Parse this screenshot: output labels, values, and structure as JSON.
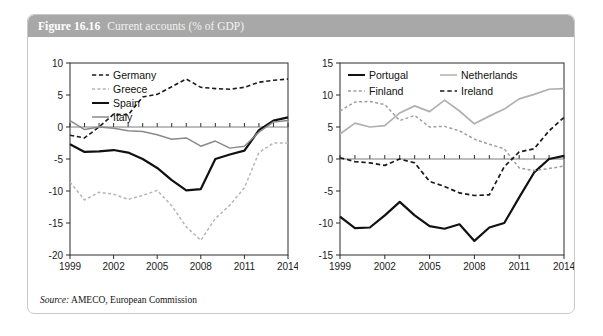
{
  "figure": {
    "number": "Figure 16.16",
    "caption": "Current accounts (% of GDP)",
    "source_label": "Source:",
    "source_text": "AMECO, European Commission",
    "header_color": "#a8a8a8",
    "border_color": "#c9c9c9"
  },
  "chart_data": [
    {
      "type": "line",
      "id": "left",
      "title": "",
      "xlabel": "",
      "ylabel": "",
      "grid": false,
      "legend_position": "top-left",
      "x": [
        1999,
        2000,
        2001,
        2002,
        2003,
        2004,
        2005,
        2006,
        2007,
        2008,
        2009,
        2010,
        2011,
        2012,
        2013,
        2014
      ],
      "xticks": [
        "1999",
        "2002",
        "2005",
        "2008",
        "2011",
        "2014"
      ],
      "xtick_values": [
        1999,
        2002,
        2005,
        2008,
        2011,
        2014
      ],
      "xlim": [
        1999,
        2014
      ],
      "yticks": [
        "10",
        "5",
        "0",
        "-5",
        "-10",
        "-15",
        "-20"
      ],
      "ytick_values": [
        10,
        5,
        0,
        -5,
        -10,
        -15,
        -20
      ],
      "ylim": [
        -20,
        10
      ],
      "series": [
        {
          "name": "Germany",
          "style": "dashed",
          "color": "#1a1a1a",
          "width": 1.6,
          "values": [
            -1.3,
            -1.7,
            0.0,
            2.0,
            1.9,
            4.7,
            5.1,
            6.3,
            7.5,
            6.2,
            6.0,
            5.9,
            6.2,
            7.0,
            7.3,
            7.5
          ]
        },
        {
          "name": "Greece",
          "style": "dotted",
          "color": "#b5b5b5",
          "width": 1.5,
          "values": [
            -8.6,
            -11.4,
            -10.2,
            -10.5,
            -11.3,
            -10.7,
            -9.9,
            -12.3,
            -15.6,
            -17.7,
            -14.3,
            -12.2,
            -9.5,
            -4.0,
            -2.5,
            -2.5
          ]
        },
        {
          "name": "Spain",
          "style": "solid",
          "color": "#111111",
          "width": 2.2,
          "values": [
            -2.7,
            -3.9,
            -3.8,
            -3.6,
            -4.0,
            -5.0,
            -6.4,
            -8.3,
            -9.9,
            -9.7,
            -5.0,
            -4.3,
            -3.7,
            -0.5,
            1.0,
            1.5
          ]
        },
        {
          "name": "Italy",
          "style": "solid",
          "color": "#8a8a8a",
          "width": 1.5,
          "values": [
            1.0,
            -0.4,
            0.0,
            -0.2,
            -0.6,
            -0.7,
            -1.2,
            -1.9,
            -1.7,
            -3.0,
            -2.2,
            -3.3,
            -3.0,
            -0.8,
            0.8,
            1.0
          ]
        }
      ]
    },
    {
      "type": "line",
      "id": "right",
      "title": "",
      "xlabel": "",
      "ylabel": "",
      "grid": false,
      "legend_position": "top",
      "x": [
        1999,
        2000,
        2001,
        2002,
        2003,
        2004,
        2005,
        2006,
        2007,
        2008,
        2009,
        2010,
        2011,
        2012,
        2013,
        2014
      ],
      "xticks": [
        "1999",
        "2002",
        "2005",
        "2008",
        "2011",
        "2014"
      ],
      "xtick_values": [
        1999,
        2002,
        2005,
        2008,
        2011,
        2014
      ],
      "xlim": [
        1999,
        2014
      ],
      "yticks": [
        "15",
        "10",
        "5",
        "0",
        "-5",
        "-10",
        "-15"
      ],
      "ytick_values": [
        15,
        10,
        5,
        0,
        -5,
        -10,
        -15
      ],
      "ylim": [
        -15,
        15
      ],
      "series": [
        {
          "name": "Portugal",
          "style": "solid",
          "color": "#111111",
          "width": 2.2,
          "values": [
            -9.0,
            -10.8,
            -10.7,
            -8.8,
            -6.7,
            -8.8,
            -10.5,
            -10.9,
            -10.2,
            -12.8,
            -10.7,
            -10.0,
            -6.0,
            -2.1,
            0.0,
            0.5
          ]
        },
        {
          "name": "Netherlands",
          "style": "solid",
          "color": "#b0b0b0",
          "width": 1.7,
          "values": [
            3.9,
            5.6,
            5.0,
            5.2,
            7.2,
            8.3,
            7.4,
            9.2,
            7.5,
            5.5,
            6.7,
            7.8,
            9.4,
            10.1,
            10.9,
            11.0
          ]
        },
        {
          "name": "Finland",
          "style": "dotted",
          "color": "#9e9e9e",
          "width": 1.5,
          "values": [
            7.5,
            8.9,
            9.0,
            8.5,
            6.0,
            6.8,
            5.0,
            5.1,
            4.4,
            3.1,
            2.3,
            1.6,
            -1.4,
            -1.8,
            -1.5,
            -1.1
          ]
        },
        {
          "name": "Ireland",
          "style": "dashed",
          "color": "#1a1a1a",
          "width": 1.7,
          "values": [
            0.2,
            -0.4,
            -0.6,
            -1.0,
            0.0,
            -0.6,
            -3.5,
            -4.3,
            -5.3,
            -5.7,
            -5.6,
            -1.2,
            1.1,
            1.6,
            4.4,
            6.5
          ]
        }
      ]
    }
  ]
}
